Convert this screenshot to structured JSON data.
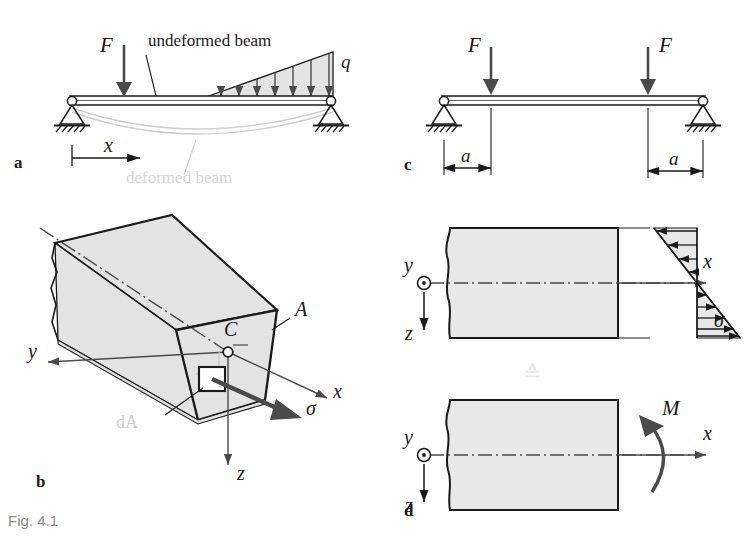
{
  "figure": {
    "caption": "Fig. 4.1",
    "caption_color": "#8a8a8a",
    "background": "#ffffff",
    "ink": "#1a1a1a",
    "gray_ink": "#555555",
    "faint": "#d8d8d8",
    "fill_gray": "#e3e3e3",
    "arrow_gray": "#4a4a4a"
  },
  "panels": {
    "a": {
      "label": "a",
      "force_label": "F",
      "load_label": "q",
      "axis_label": "x",
      "annotation_undeformed": "undeformed beam",
      "annotation_deformed": "deformed beam",
      "load_arrow_count": 7,
      "support_left": "pinned-support",
      "support_right": "pinned-support"
    },
    "b": {
      "label": "b",
      "area_label": "A",
      "centroid_label": "C",
      "axis_x": "x",
      "axis_y": "y",
      "axis_z": "z",
      "element_label": "dA",
      "stress_label": "σ",
      "offset_label": "z"
    },
    "c": {
      "label": "c",
      "force_left_label": "F",
      "force_right_label": "F",
      "dim_left_label": "a",
      "dim_right_label": "a",
      "support_left": "pinned-support",
      "support_right": "pinned-support"
    },
    "d": {
      "label": "d",
      "axis_x_top": "x",
      "axis_y_top": "y",
      "axis_z_top": "z",
      "stress_label": "σ",
      "equivalence_symbol": "≙",
      "axis_x_bottom": "x",
      "axis_y_bottom": "y",
      "axis_z_bottom": "z",
      "moment_label": "M",
      "stress_arrows_upper": 4,
      "stress_arrows_lower": 5
    }
  }
}
